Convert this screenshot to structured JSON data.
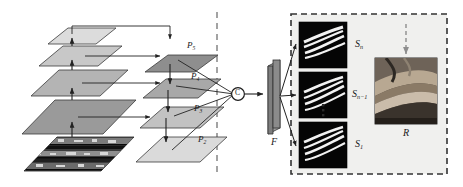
{
  "figure": {
    "type": "architecture-diagram",
    "background_color": "#ffffff",
    "width": 463,
    "height": 187
  },
  "left_panel": {
    "name": "feature-pyramid-backbone",
    "input_image_label": "",
    "backbone_layers": [
      {
        "id": "c2",
        "fill": "#9a9a9a"
      },
      {
        "id": "c3",
        "fill": "#b4b4b4"
      },
      {
        "id": "c4",
        "fill": "#c8c8c8"
      },
      {
        "id": "c5",
        "fill": "#dcdcdc"
      }
    ],
    "pyramid_levels": [
      {
        "label": "P",
        "subscript": "5",
        "fill": "#8e8e8e"
      },
      {
        "label": "P",
        "subscript": "4",
        "fill": "#a8a8a8"
      },
      {
        "label": "P",
        "subscript": "3",
        "fill": "#c2c2c2"
      },
      {
        "label": "P",
        "subscript": "2",
        "fill": "#dadada"
      }
    ]
  },
  "divider": {
    "name": "stage-divider",
    "style": "dashed-vertical",
    "color": "#8d8d8d"
  },
  "center": {
    "concat_node_label": "C",
    "feature_block_label": "F",
    "feature_block_color": "#8b8b8b"
  },
  "right_panel": {
    "name": "segmentation-outputs",
    "border_style": "dashed",
    "border_color": "#333333",
    "background_color": "#f0f0ee",
    "segmentation_maps": [
      {
        "label": "S",
        "subscript": "n"
      },
      {
        "label": "S",
        "subscript": "n−1"
      },
      {
        "label": "S",
        "subscript": "1"
      }
    ],
    "ellipsis": "⋮",
    "result": {
      "label": "R",
      "subscript": ""
    }
  },
  "colors": {
    "line": "#222222",
    "dashed_gray": "#8d8d8d",
    "panel_bg": "#f0f0ee",
    "map_bg": "#050505",
    "curve": "#f2f2f2"
  }
}
